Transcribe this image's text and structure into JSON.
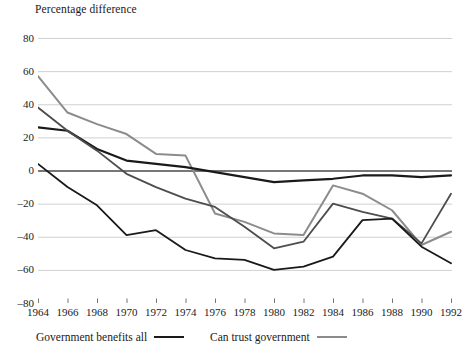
{
  "chart_data": {
    "type": "line",
    "title": "Percentage difference",
    "xlabel": "",
    "ylabel": "Percentage difference",
    "ylim": [
      -80,
      80
    ],
    "ytick_step": 20,
    "yticks": [
      "80",
      "60",
      "40",
      "20",
      "0",
      "–20",
      "–40",
      "–60",
      "–80"
    ],
    "ytick_values": [
      80,
      60,
      40,
      20,
      0,
      -20,
      -40,
      -60,
      -80
    ],
    "grid": true,
    "grid_axis": "y",
    "legend_position": "bottom",
    "x": [
      1964,
      1966,
      1968,
      1970,
      1972,
      1974,
      1976,
      1978,
      1980,
      1982,
      1984,
      1986,
      1988,
      1990,
      1992
    ],
    "categories": [
      "1964",
      "1966",
      "1968",
      "1970",
      "1972",
      "1974",
      "1976",
      "1978",
      "1980",
      "1982",
      "1984",
      "1986",
      "1988",
      "1990",
      "1992"
    ],
    "series": [
      {
        "name": "Can trust government",
        "color": "#8c8c8c",
        "width": 2.0,
        "values": [
          57,
          35,
          28,
          22,
          10,
          9,
          -26,
          -31,
          -38,
          -39,
          -9,
          -14,
          -24,
          -45,
          -37
        ]
      },
      {
        "name": "Government benefits all",
        "color": "#1a1a1a",
        "width": 2.2,
        "values": [
          26,
          24,
          13,
          6,
          4,
          2,
          -1,
          -4,
          -7,
          -6,
          -5,
          -3,
          -3,
          -4,
          -3
        ]
      },
      {
        "name": "line-3",
        "color": "#4d4d4d",
        "width": 1.8,
        "values": [
          38,
          24,
          12,
          -2,
          -10,
          -17,
          -22,
          -34,
          -47,
          -43,
          -20,
          -25,
          -29,
          -44,
          -14
        ]
      },
      {
        "name": "line-4",
        "color": "#1a1a1a",
        "width": 1.8,
        "values": [
          4,
          -10,
          -21,
          -39,
          -36,
          -48,
          -53,
          -54,
          -60,
          -58,
          -52,
          -30,
          -29,
          -46,
          -56
        ]
      }
    ],
    "legend": [
      {
        "label": "Government benefits all",
        "color": "#1a1a1a",
        "width": 2.4
      },
      {
        "label": "Can trust government",
        "color": "#8c8c8c",
        "width": 2.4
      }
    ]
  },
  "axes": {
    "y_axis_title": "Percentage difference"
  }
}
